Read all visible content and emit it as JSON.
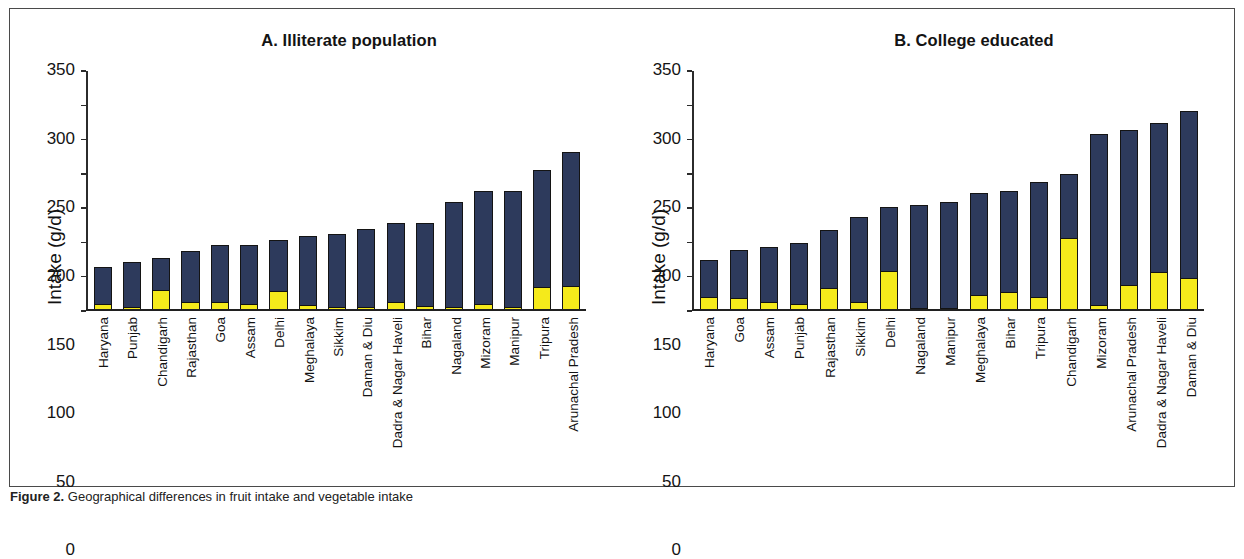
{
  "figure": {
    "caption_label": "Figure 2.",
    "caption_text": "Geographical differences in fruit intake and vegetable intake"
  },
  "panels": [
    {
      "id": "A",
      "title": "A.  Illiterate population",
      "y_axis_title": "Intake (g/d)"
    },
    {
      "id": "B",
      "title": "B.  College educated",
      "y_axis_title": "Intake (g/d)"
    }
  ],
  "axis": {
    "ticks": [
      "0",
      "50",
      "100",
      "150",
      "200",
      "250",
      "300",
      "350"
    ]
  },
  "colors": {
    "fruit": "#f5ea1b",
    "vegetable": "#2d3a5c",
    "outline": "#131313"
  },
  "chart_data": [
    {
      "type": "bar",
      "title": "A.  Illiterate population",
      "xlabel": "",
      "ylabel": "Intake (g/d)",
      "ylim": [
        0,
        350
      ],
      "ytick_step": 50,
      "grid": false,
      "legend": "none",
      "stacked": true,
      "categories": [
        "Haryana",
        "Punjab",
        "Chandigarh",
        "Rajasthan",
        "Goa",
        "Assam",
        "Delhi",
        "Meghalaya",
        "Sikkim",
        "Daman & Diu",
        "Dadra & Nagar Haveli",
        "Bihar",
        "Nagaland",
        "Mizoram",
        "Manipur",
        "Tripura",
        "Arunachal Pradesh"
      ],
      "series": [
        {
          "name": "fruit",
          "values": [
            6,
            2,
            27,
            9,
            10,
            7,
            26,
            5,
            2,
            2,
            10,
            3,
            2,
            6,
            2,
            32,
            33
          ]
        },
        {
          "name": "vegetable",
          "values": [
            54,
            66,
            47,
            75,
            83,
            85,
            74,
            101,
            106,
            114,
            114,
            121,
            153,
            166,
            169,
            170,
            195
          ]
        }
      ],
      "totals": [
        60,
        68,
        74,
        84,
        93,
        92,
        100,
        106,
        108,
        116,
        124,
        124,
        155,
        172,
        171,
        202,
        228
      ]
    },
    {
      "type": "bar",
      "title": "B.  College educated",
      "xlabel": "",
      "ylabel": "Intake (g/d)",
      "ylim": [
        0,
        350
      ],
      "ytick_step": 50,
      "grid": false,
      "legend": "none",
      "stacked": true,
      "categories": [
        "Haryana",
        "Goa",
        "Assam",
        "Punjab",
        "Rajasthan",
        "Sikkim",
        "Delhi",
        "Nagaland",
        "Manipur",
        "Meghalaya",
        "Bihar",
        "Tripura",
        "Chandigarh",
        "Mizoram",
        "Arunachal Pradesh",
        "Dadra & Nagar Haveli",
        "Daman & Diu"
      ],
      "series": [
        {
          "name": "fruit",
          "values": [
            17,
            16,
            10,
            6,
            30,
            9,
            55,
            1,
            1,
            20,
            24,
            17,
            104,
            5,
            35,
            54,
            45
          ]
        },
        {
          "name": "vegetable",
          "values": [
            54,
            69,
            79,
            90,
            84,
            124,
            93,
            150,
            154,
            148,
            147,
            167,
            92,
            249,
            225,
            216,
            243
          ]
        }
      ],
      "totals": [
        71,
        85,
        89,
        96,
        114,
        133,
        148,
        151,
        155,
        168,
        171,
        184,
        196,
        254,
        260,
        270,
        288
      ]
    }
  ]
}
